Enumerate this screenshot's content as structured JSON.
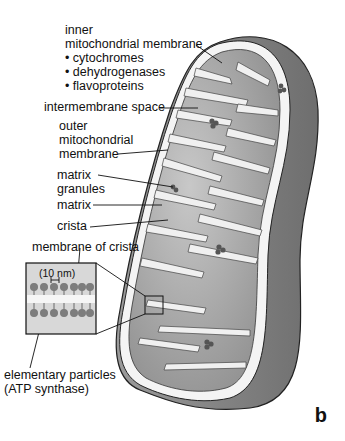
{
  "figure": {
    "panel_label": "b"
  },
  "labels": {
    "inner_membrane": {
      "title_line1": "inner",
      "title_line2": "mitochondrial membrane",
      "bullets": [
        "• cytochromes",
        "• dehydrogenases",
        "• flavoproteins"
      ]
    },
    "intermembrane_space": "intermembrane space",
    "outer_membrane": [
      "outer",
      "mitochondrial",
      "membrane"
    ],
    "matrix_granules": [
      "matrix",
      "granules"
    ],
    "matrix": "matrix",
    "crista": "crista",
    "membrane_of_crista": "membrane of crista",
    "scale": "(10 nm)",
    "elementary_particles": [
      "elementary particles",
      "(ATP synthase)"
    ]
  },
  "colors": {
    "outer_shell": "#7a7a7a",
    "intermembrane": "#f4f4f4",
    "matrix": "#9a9a9a",
    "cristae": "#f0f0f0",
    "inset_bg": "#d8d8d8",
    "particle": "#7d7d7d"
  }
}
